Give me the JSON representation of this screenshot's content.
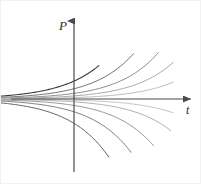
{
  "figure": {
    "name": "exponential-growth-decay-solution-curves",
    "background_color": "#ffffff",
    "width": 201,
    "height": 184
  },
  "axes": {
    "vertical": {
      "label": "P",
      "name": "p-axis",
      "color": "#4a4a4a",
      "x": 73,
      "top_y": 20,
      "bottom_y": 171,
      "arrow": "up"
    },
    "horizontal": {
      "label": "t",
      "name": "t-axis",
      "color": "#4a4a4a",
      "y": 98,
      "left_x": 10,
      "right_x": 190,
      "arrow": "right"
    },
    "origin": {
      "x": 73,
      "y": 98
    }
  },
  "chart_data": {
    "type": "line",
    "title": "",
    "xlabel": "t",
    "ylabel": "P",
    "grid": false,
    "legend": false,
    "xlim": [
      -3.5,
      4.0
    ],
    "ylim": [
      -3.2,
      3.2
    ],
    "series": [
      {
        "name": "curve-above-1",
        "equation": "P = 0.70 e^{0.62 t}",
        "amplitude": 0.7,
        "rate": 0.62,
        "color": "#3a3a3a",
        "width": 1.1,
        "x": [
          -3.5,
          -3.0,
          -2.5,
          -2.0,
          -1.5,
          -1.0,
          -0.5,
          0.0,
          0.5,
          1.0
        ],
        "y": [
          0.08,
          0.11,
          0.15,
          0.2,
          0.28,
          0.38,
          0.51,
          0.7,
          0.95,
          1.3
        ]
      },
      {
        "name": "curve-above-2",
        "equation": "P = 0.40 e^{0.62 t}",
        "amplitude": 0.4,
        "rate": 0.62,
        "color": "#6e6e6e",
        "width": 1.0,
        "x": [
          -3.5,
          -3.0,
          -2.5,
          -2.0,
          -1.5,
          -1.0,
          -0.5,
          0.0,
          0.5,
          1.0,
          1.5,
          2.0,
          2.4
        ],
        "y": [
          0.05,
          0.06,
          0.08,
          0.12,
          0.16,
          0.21,
          0.29,
          0.4,
          0.55,
          0.74,
          1.01,
          1.38,
          1.77
        ]
      },
      {
        "name": "curve-above-3",
        "equation": "P = 0.22 e^{0.62 t}",
        "amplitude": 0.22,
        "rate": 0.62,
        "color": "#8c8c8c",
        "width": 1.0,
        "x": [
          -3.5,
          -3.0,
          -2.5,
          -2.0,
          -1.5,
          -1.0,
          -0.5,
          0.0,
          0.5,
          1.0,
          1.5,
          2.0,
          2.5,
          3.0,
          3.4
        ],
        "y": [
          0.03,
          0.03,
          0.05,
          0.06,
          0.09,
          0.12,
          0.16,
          0.22,
          0.3,
          0.41,
          0.56,
          0.76,
          1.04,
          1.41,
          1.8
        ]
      },
      {
        "name": "curve-above-4",
        "equation": "P = 0.12 e^{0.62 t}",
        "amplitude": 0.12,
        "rate": 0.62,
        "color": "#a8a8a8",
        "width": 1.0,
        "x": [
          -3.5,
          -3.0,
          -2.5,
          -2.0,
          -1.5,
          -1.0,
          -0.5,
          0.0,
          0.5,
          1.0,
          1.5,
          2.0,
          2.5,
          3.0,
          3.5,
          4.0
        ],
        "y": [
          0.014,
          0.019,
          0.025,
          0.035,
          0.047,
          0.064,
          0.088,
          0.12,
          0.16,
          0.22,
          0.3,
          0.41,
          0.57,
          0.77,
          1.05,
          1.43
        ]
      },
      {
        "name": "curve-above-5",
        "equation": "P = 0.055 e^{0.62 t}",
        "amplitude": 0.055,
        "rate": 0.62,
        "color": "#bdbdbd",
        "width": 1.0,
        "x": [
          -3.5,
          -3.0,
          -2.5,
          -2.0,
          -1.5,
          -1.0,
          -0.5,
          0.0,
          0.5,
          1.0,
          1.5,
          2.0,
          2.5,
          3.0,
          3.5,
          4.0
        ],
        "y": [
          0.006,
          0.009,
          0.012,
          0.016,
          0.022,
          0.029,
          0.04,
          0.055,
          0.075,
          0.1,
          0.14,
          0.19,
          0.26,
          0.35,
          0.48,
          0.66
        ]
      },
      {
        "name": "curve-below-1",
        "equation": "P = -0.045 e^{0.62 t}",
        "amplitude": -0.045,
        "rate": 0.62,
        "color": "#c4c4c4",
        "width": 1.0,
        "x": [
          -3.5,
          -3.0,
          -2.5,
          -2.0,
          -1.5,
          -1.0,
          -0.5,
          0.0,
          0.5,
          1.0,
          1.5,
          2.0,
          2.5,
          3.0,
          3.5,
          4.0
        ],
        "y": [
          -0.005,
          -0.007,
          -0.01,
          -0.013,
          -0.018,
          -0.024,
          -0.033,
          -0.045,
          -0.061,
          -0.084,
          -0.114,
          -0.156,
          -0.212,
          -0.289,
          -0.394,
          -0.537
        ]
      },
      {
        "name": "curve-below-2",
        "equation": "P = -0.11 e^{0.62 t}",
        "amplitude": -0.11,
        "rate": 0.62,
        "color": "#b0b0b0",
        "width": 1.0,
        "x": [
          -3.5,
          -3.0,
          -2.5,
          -2.0,
          -1.5,
          -1.0,
          -0.5,
          0.0,
          0.5,
          1.0,
          1.5,
          2.0,
          2.5,
          3.0,
          3.5,
          3.9
        ],
        "y": [
          -0.013,
          -0.017,
          -0.023,
          -0.032,
          -0.043,
          -0.059,
          -0.081,
          -0.11,
          -0.15,
          -0.2,
          -0.28,
          -0.38,
          -0.52,
          -0.71,
          -0.96,
          -1.23
        ]
      },
      {
        "name": "curve-below-3",
        "equation": "P = -0.25 e^{0.62 t}",
        "amplitude": -0.25,
        "rate": 0.62,
        "color": "#979797",
        "width": 1.0,
        "x": [
          -3.5,
          -3.0,
          -2.5,
          -2.0,
          -1.5,
          -1.0,
          -0.5,
          0.0,
          0.5,
          1.0,
          1.5,
          2.0,
          2.5,
          3.0,
          3.2
        ],
        "y": [
          -0.029,
          -0.039,
          -0.053,
          -0.072,
          -0.098,
          -0.134,
          -0.183,
          -0.25,
          -0.34,
          -0.47,
          -0.63,
          -0.86,
          -1.18,
          -1.6,
          -1.81
        ]
      },
      {
        "name": "curve-below-4",
        "equation": "P = -0.50 e^{0.62 t}",
        "amplitude": -0.5,
        "rate": 0.62,
        "color": "#7d7d7d",
        "width": 1.0,
        "x": [
          -3.5,
          -3.0,
          -2.5,
          -2.0,
          -1.5,
          -1.0,
          -0.5,
          0.0,
          0.5,
          1.0,
          1.5,
          2.0,
          2.3
        ],
        "y": [
          -0.057,
          -0.078,
          -0.106,
          -0.145,
          -0.197,
          -0.269,
          -0.366,
          -0.5,
          -0.68,
          -0.93,
          -1.27,
          -1.73,
          -2.08
        ]
      },
      {
        "name": "curve-below-5",
        "equation": "P = -0.95 e^{0.62 t}",
        "amplitude": -0.95,
        "rate": 0.62,
        "color": "#5e5e5e",
        "width": 1.0,
        "x": [
          -3.5,
          -3.0,
          -2.5,
          -2.0,
          -1.5,
          -1.0,
          -0.5,
          0.0,
          0.5,
          1.0,
          1.4
        ],
        "y": [
          -0.108,
          -0.148,
          -0.201,
          -0.275,
          -0.375,
          -0.511,
          -0.697,
          -0.95,
          -1.3,
          -1.77,
          -2.26
        ]
      }
    ]
  }
}
